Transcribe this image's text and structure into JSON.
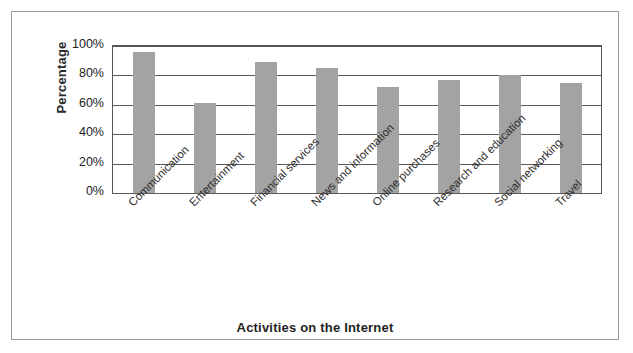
{
  "chart_data": {
    "type": "bar",
    "title": "",
    "xlabel": "Activities on the Internet",
    "ylabel": "Percentage",
    "categories": [
      "Communication",
      "Entertainment",
      "Financial services",
      "News and information",
      "Online purchases",
      "Research and education",
      "Social networking",
      "Travel"
    ],
    "values": [
      96,
      61,
      89,
      85,
      72,
      77,
      80,
      75
    ],
    "ylim": [
      0,
      100
    ],
    "ytick_labels": [
      "100%",
      "80%",
      "60%",
      "40%",
      "20%",
      "0%"
    ],
    "ytick_values": [
      100,
      80,
      60,
      40,
      20,
      0
    ],
    "grid": true,
    "legend": "none",
    "bar_color": "#a3a3a3",
    "axis_color": "#595959",
    "frame_color": "#9a9a9a"
  }
}
